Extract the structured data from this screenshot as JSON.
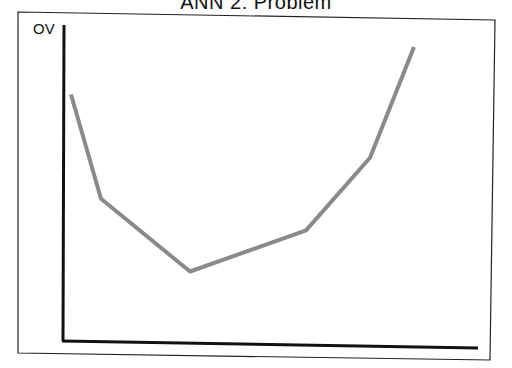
{
  "chart_data": {
    "type": "line",
    "title": "ANN 2: Problem",
    "xlabel": "",
    "ylabel": "OV",
    "grid": false,
    "legend": null,
    "x": [
      1,
      2,
      3,
      4,
      5,
      6
    ],
    "series": [
      {
        "name": "OV",
        "color": "#8a8a8a",
        "values": [
          0.78,
          0.45,
          0.22,
          0.35,
          0.58,
          0.93
        ]
      }
    ],
    "ylim": [
      0,
      1
    ],
    "tick_labels": {
      "x": [],
      "y": []
    }
  },
  "colors": {
    "line": "#8a8a8a",
    "axis": "#111111",
    "frame": "#222222"
  }
}
